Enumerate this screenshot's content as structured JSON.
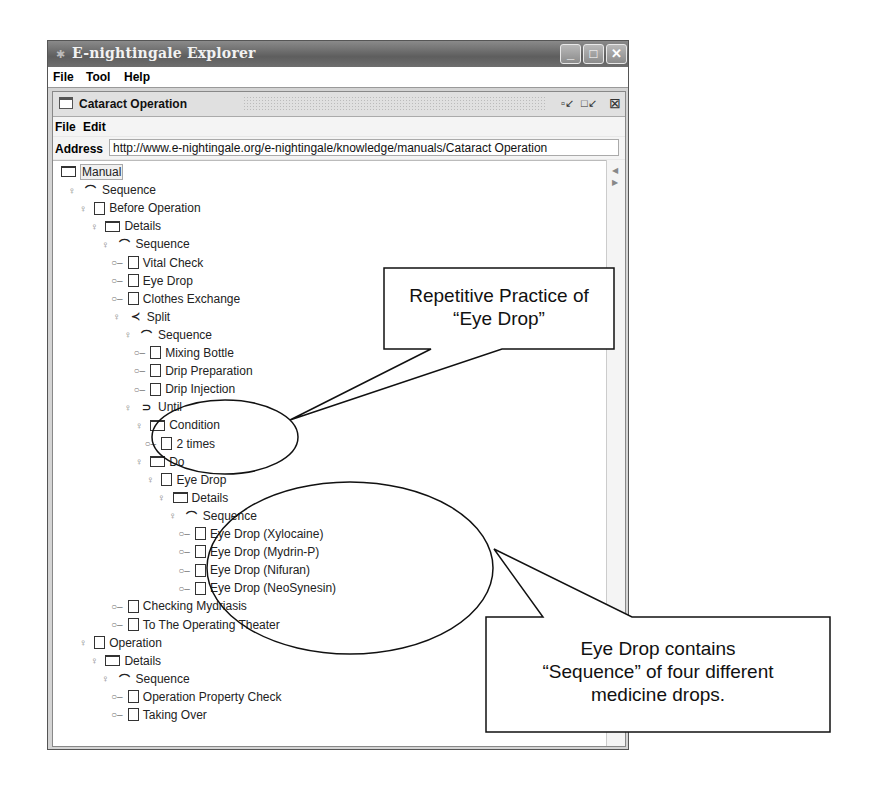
{
  "window": {
    "title": "E-nightingale Explorer",
    "menu": [
      "File",
      "Tool",
      "Help"
    ],
    "controls": {
      "minimize": "minimize-icon",
      "maximize": "maximize-icon",
      "close": "close-icon"
    }
  },
  "inner_frame": {
    "title": "Cataract Operation",
    "menu": [
      "File",
      "Edit"
    ],
    "address_label": "Address",
    "address_value": "http://www.e-nightingale.org/e-nightingale/knowledge/manuals/Cataract Operation"
  },
  "tree": [
    {
      "label": "Manual",
      "icon": "folder",
      "handle": "",
      "level": 0
    },
    {
      "label": "Sequence",
      "icon": "sequence",
      "handle": "expanded",
      "level": 1
    },
    {
      "label": "Before Operation",
      "icon": "document",
      "handle": "expanded",
      "level": 2
    },
    {
      "label": "Details",
      "icon": "folder",
      "handle": "expanded",
      "level": 3
    },
    {
      "label": "Sequence",
      "icon": "sequence",
      "handle": "expanded",
      "level": 4
    },
    {
      "label": "Vital Check",
      "icon": "document",
      "handle": "leaf",
      "level": 5
    },
    {
      "label": "Eye Drop",
      "icon": "document",
      "handle": "leaf",
      "level": 5
    },
    {
      "label": "Clothes Exchange",
      "icon": "document",
      "handle": "leaf",
      "level": 5
    },
    {
      "label": "Split",
      "icon": "split",
      "handle": "expanded",
      "level": 5
    },
    {
      "label": "Sequence",
      "icon": "sequence",
      "handle": "expanded",
      "level": 6
    },
    {
      "label": "Mixing Bottle",
      "icon": "document",
      "handle": "leaf",
      "level": 7
    },
    {
      "label": "Drip Preparation",
      "icon": "document",
      "handle": "leaf",
      "level": 7
    },
    {
      "label": "Drip Injection",
      "icon": "document",
      "handle": "leaf",
      "level": 7
    },
    {
      "label": "Until",
      "icon": "until",
      "handle": "expanded",
      "level": 6
    },
    {
      "label": "Condition",
      "icon": "folder",
      "handle": "expanded",
      "level": 7
    },
    {
      "label": "2 times",
      "icon": "document",
      "handle": "leaf",
      "level": 8
    },
    {
      "label": "Do",
      "icon": "folder",
      "handle": "expanded",
      "level": 7
    },
    {
      "label": "Eye Drop",
      "icon": "document",
      "handle": "expanded",
      "level": 8
    },
    {
      "label": "Details",
      "icon": "folder",
      "handle": "expanded",
      "level": 9
    },
    {
      "label": "Sequence",
      "icon": "sequence",
      "handle": "expanded",
      "level": 10
    },
    {
      "label": "Eye Drop (Xylocaine)",
      "icon": "document",
      "handle": "leaf",
      "level": 11
    },
    {
      "label": "Eye Drop (Mydrin-P)",
      "icon": "document",
      "handle": "leaf",
      "level": 11
    },
    {
      "label": "Eye Drop (Nifuran)",
      "icon": "document",
      "handle": "leaf",
      "level": 11
    },
    {
      "label": "Eye Drop (NeoSynesin)",
      "icon": "document",
      "handle": "leaf",
      "level": 11
    },
    {
      "label": "Checking Mydriasis",
      "icon": "document",
      "handle": "leaf",
      "level": 5
    },
    {
      "label": "To The Operating Theater",
      "icon": "document",
      "handle": "leaf",
      "level": 5
    },
    {
      "label": "Operation",
      "icon": "document",
      "handle": "expanded",
      "level": 2
    },
    {
      "label": "Details",
      "icon": "folder",
      "handle": "expanded",
      "level": 3
    },
    {
      "label": "Sequence",
      "icon": "sequence",
      "handle": "expanded",
      "level": 4
    },
    {
      "label": "Operation Property Check",
      "icon": "document",
      "handle": "leaf",
      "level": 5
    },
    {
      "label": "Taking Over",
      "icon": "document",
      "handle": "leaf",
      "level": 5
    }
  ],
  "annotations": {
    "callout_top": {
      "line1": "Repetitive Practice of",
      "line2": "“Eye Drop”"
    },
    "callout_bottom": {
      "line1": "Eye Drop contains",
      "line2": "“Sequence” of four different",
      "line3": "medicine drops."
    }
  }
}
